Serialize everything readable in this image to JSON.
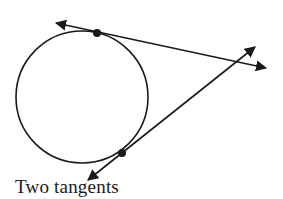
{
  "diagram": {
    "caption": "Two tangents",
    "colors": {
      "stroke": "#1a1a1a",
      "background": "#ffffff"
    },
    "circle": {
      "cx": 82,
      "cy": 97,
      "r": 66
    },
    "tangent_points": [
      {
        "name": "upper",
        "x": 97,
        "y": 33
      },
      {
        "name": "lower",
        "x": 122,
        "y": 153
      }
    ],
    "lines": [
      {
        "name": "upper-tangent",
        "x1": 56,
        "y1": 23,
        "x2": 266,
        "y2": 68
      },
      {
        "name": "lower-tangent",
        "x1": 88,
        "y1": 180,
        "x2": 255,
        "y2": 47
      }
    ]
  }
}
